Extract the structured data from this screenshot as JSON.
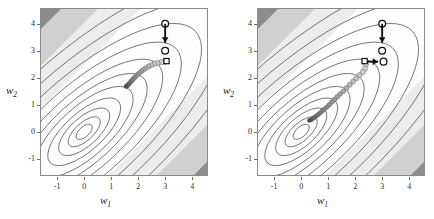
{
  "figure": {
    "panel_count": 2,
    "background_colors": {
      "band_dark": "#8c8c8c",
      "band_mid": "#d0d0d0",
      "band_light": "#ececec",
      "band_white": "#fdfdfd",
      "contour_line": "#4a4a4a",
      "frame": "#8a8a8a",
      "marker_start": "#d9d9d9",
      "marker_end": "#4d4d4d",
      "annotation": "#111111"
    }
  },
  "chart_data": [
    {
      "type": "line",
      "panel": "left",
      "title": "",
      "xlabel": "w_1",
      "ylabel": "w_2",
      "xlim": [
        -1.6,
        4.55
      ],
      "ylim": [
        -1.6,
        4.55
      ],
      "xticks": [
        -1,
        0,
        1,
        2,
        3,
        4
      ],
      "yticks": [
        -1,
        0,
        1,
        2,
        3,
        4
      ],
      "xtick_labels": [
        "-1",
        "0",
        "1",
        "2",
        "3",
        "4"
      ],
      "ytick_labels": [
        "-1",
        "0",
        "1",
        "2",
        "3",
        "4"
      ],
      "grid": false,
      "legend": "none",
      "contour_center": [
        0.0,
        0.0
      ],
      "contour_description": "tilted concentric ellipses of a quadratic objective, plus diagonal shaded bands from upper-left (dark) to lower-right (dark)",
      "trajectory": {
        "name": "optimizer-path-left",
        "marker": "circle",
        "start_point": [
          3.0,
          2.6
        ],
        "end_point": [
          1.55,
          1.68
        ],
        "points": [
          [
            3.0,
            2.6
          ],
          [
            2.86,
            2.58
          ],
          [
            2.72,
            2.55
          ],
          [
            2.6,
            2.52
          ],
          [
            2.48,
            2.47
          ],
          [
            2.38,
            2.42
          ],
          [
            2.28,
            2.36
          ],
          [
            2.2,
            2.3
          ],
          [
            2.12,
            2.24
          ],
          [
            2.04,
            2.18
          ],
          [
            1.98,
            2.12
          ],
          [
            1.92,
            2.06
          ],
          [
            1.86,
            2.0
          ],
          [
            1.81,
            1.95
          ],
          [
            1.77,
            1.9
          ],
          [
            1.73,
            1.86
          ],
          [
            1.7,
            1.82
          ],
          [
            1.67,
            1.79
          ],
          [
            1.64,
            1.76
          ],
          [
            1.62,
            1.74
          ],
          [
            1.6,
            1.72
          ],
          [
            1.58,
            1.7
          ],
          [
            1.57,
            1.69
          ],
          [
            1.56,
            1.685
          ],
          [
            1.55,
            1.68
          ]
        ]
      },
      "annotations": [
        {
          "name": "start-circle-top",
          "type": "circle",
          "at": [
            3.0,
            4.0
          ]
        },
        {
          "name": "down-arrow",
          "type": "arrow",
          "from": [
            3.0,
            4.0
          ],
          "to": [
            3.0,
            3.3
          ]
        },
        {
          "name": "mid-circle",
          "type": "circle",
          "at": [
            3.0,
            3.0
          ]
        },
        {
          "name": "square-marker",
          "type": "square",
          "at": [
            3.05,
            2.62
          ]
        }
      ]
    },
    {
      "type": "line",
      "panel": "right",
      "title": "",
      "xlabel": "w_1",
      "ylabel": "w_2",
      "xlim": [
        -1.6,
        4.55
      ],
      "ylim": [
        -1.6,
        4.55
      ],
      "xticks": [
        -1,
        0,
        1,
        2,
        3,
        4
      ],
      "yticks": [
        -1,
        0,
        1,
        2,
        3,
        4
      ],
      "xtick_labels": [
        "-1",
        "0",
        "1",
        "2",
        "3",
        "4"
      ],
      "ytick_labels": [
        "-1",
        "0",
        "1",
        "2",
        "3",
        "4"
      ],
      "grid": false,
      "legend": "none",
      "contour_center": [
        0.0,
        0.0
      ],
      "contour_description": "tilted concentric ellipses of a quadratic objective, plus diagonal shaded bands from upper-left (dark) to lower-right (dark)",
      "trajectory": {
        "name": "optimizer-path-right",
        "marker": "circle",
        "start_point": [
          2.4,
          2.5
        ],
        "end_point": [
          0.3,
          0.42
        ],
        "points": [
          [
            2.4,
            2.5
          ],
          [
            2.36,
            2.34
          ],
          [
            2.28,
            2.22
          ],
          [
            2.16,
            2.1
          ],
          [
            2.04,
            1.98
          ],
          [
            1.92,
            1.86
          ],
          [
            1.8,
            1.74
          ],
          [
            1.68,
            1.62
          ],
          [
            1.56,
            1.5
          ],
          [
            1.44,
            1.4
          ],
          [
            1.34,
            1.3
          ],
          [
            1.24,
            1.2
          ],
          [
            1.14,
            1.1
          ],
          [
            1.04,
            1.0
          ],
          [
            0.95,
            0.92
          ],
          [
            0.86,
            0.84
          ],
          [
            0.78,
            0.77
          ],
          [
            0.7,
            0.7
          ],
          [
            0.63,
            0.64
          ],
          [
            0.57,
            0.59
          ],
          [
            0.51,
            0.55
          ],
          [
            0.46,
            0.51
          ],
          [
            0.42,
            0.48
          ],
          [
            0.38,
            0.46
          ],
          [
            0.35,
            0.44
          ],
          [
            0.32,
            0.43
          ],
          [
            0.3,
            0.42
          ]
        ]
      },
      "annotations": [
        {
          "name": "start-circle-top",
          "type": "circle",
          "at": [
            3.0,
            4.0
          ]
        },
        {
          "name": "down-arrow",
          "type": "arrow",
          "from": [
            3.0,
            4.0
          ],
          "to": [
            3.0,
            3.3
          ]
        },
        {
          "name": "mid-circle",
          "type": "circle",
          "at": [
            3.0,
            3.0
          ]
        },
        {
          "name": "square-marker",
          "type": "square",
          "at": [
            2.35,
            2.62
          ]
        },
        {
          "name": "right-arrow",
          "type": "arrow",
          "from": [
            2.45,
            2.6
          ],
          "to": [
            2.85,
            2.6
          ]
        },
        {
          "name": "end-circle",
          "type": "circle",
          "at": [
            3.05,
            2.6
          ]
        }
      ]
    }
  ],
  "labels": {
    "xlabel_main": "w",
    "xlabel_sub": "1",
    "ylabel_main": "w",
    "ylabel_sub": "2",
    "left": {
      "xticks": [
        "-1",
        "0",
        "1",
        "2",
        "3",
        "4"
      ],
      "yticks": [
        "-1",
        "0",
        "1",
        "2",
        "3",
        "4"
      ]
    },
    "right": {
      "xticks": [
        "-1",
        "0",
        "1",
        "2",
        "3",
        "4"
      ],
      "yticks": [
        "-1",
        "0",
        "1",
        "2",
        "3",
        "4"
      ]
    }
  }
}
